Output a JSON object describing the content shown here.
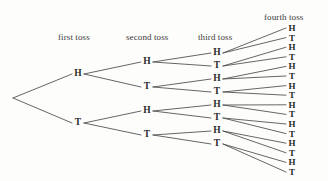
{
  "diagram": {
    "background_color": "#fdfdfc",
    "line_color": "#4a4a4a",
    "text_color": "#2b2b2b",
    "label_color": "#3b3b3b",
    "width": 328,
    "height": 181
  },
  "column_labels": [
    {
      "id": "first-toss",
      "text": "first toss",
      "x": 58,
      "y": 32
    },
    {
      "id": "second-toss",
      "text": "second toss",
      "x": 126,
      "y": 32
    },
    {
      "id": "third-toss",
      "text": "third toss",
      "x": 198,
      "y": 32
    },
    {
      "id": "fourth-toss",
      "text": "fourth toss",
      "x": 264,
      "y": 12
    }
  ],
  "root": {
    "id": "root",
    "x": 13,
    "y": 98
  },
  "levels": [
    {
      "name": "first-toss",
      "x": 78,
      "nodes": [
        {
          "id": "n-H",
          "label": "H",
          "y": 74
        },
        {
          "id": "n-T",
          "label": "T",
          "y": 123
        }
      ]
    },
    {
      "name": "second-toss",
      "x": 147,
      "nodes": [
        {
          "id": "n-HH",
          "label": "H",
          "y": 62,
          "parent": "n-H"
        },
        {
          "id": "n-HT",
          "label": "T",
          "y": 87,
          "parent": "n-H"
        },
        {
          "id": "n-TH",
          "label": "H",
          "y": 111,
          "parent": "n-T"
        },
        {
          "id": "n-TT",
          "label": "T",
          "y": 135,
          "parent": "n-T"
        }
      ]
    },
    {
      "name": "third-toss",
      "x": 217,
      "nodes": [
        {
          "id": "n-HHH",
          "label": "H",
          "y": 53,
          "parent": "n-HH"
        },
        {
          "id": "n-HHT",
          "label": "T",
          "y": 66,
          "parent": "n-HH"
        },
        {
          "id": "n-HTH",
          "label": "H",
          "y": 79,
          "parent": "n-HT"
        },
        {
          "id": "n-HTT",
          "label": "T",
          "y": 92,
          "parent": "n-HT"
        },
        {
          "id": "n-THH",
          "label": "H",
          "y": 105,
          "parent": "n-TH"
        },
        {
          "id": "n-THT",
          "label": "T",
          "y": 118,
          "parent": "n-TH"
        },
        {
          "id": "n-TTH",
          "label": "H",
          "y": 131,
          "parent": "n-TT"
        },
        {
          "id": "n-TTT",
          "label": "T",
          "y": 144,
          "parent": "n-TT"
        }
      ]
    },
    {
      "name": "fourth-toss",
      "x": 292,
      "nodes": [
        {
          "id": "n-HHHH",
          "label": "H",
          "y": 28,
          "parent": "n-HHH"
        },
        {
          "id": "n-HHHT",
          "label": "T",
          "y": 37.6,
          "parent": "n-HHH"
        },
        {
          "id": "n-HHTH",
          "label": "H",
          "y": 47.2,
          "parent": "n-HHT"
        },
        {
          "id": "n-HHTT",
          "label": "T",
          "y": 56.8,
          "parent": "n-HHT"
        },
        {
          "id": "n-HTHH",
          "label": "H",
          "y": 66.4,
          "parent": "n-HTH"
        },
        {
          "id": "n-HTHT",
          "label": "T",
          "y": 76,
          "parent": "n-HTH"
        },
        {
          "id": "n-HTTH",
          "label": "H",
          "y": 85.6,
          "parent": "n-HTT"
        },
        {
          "id": "n-HTTT",
          "label": "T",
          "y": 95.2,
          "parent": "n-HTT"
        },
        {
          "id": "n-THHH",
          "label": "H",
          "y": 104.8,
          "parent": "n-THH"
        },
        {
          "id": "n-THHT",
          "label": "T",
          "y": 114.4,
          "parent": "n-THH"
        },
        {
          "id": "n-THTH",
          "label": "H",
          "y": 124,
          "parent": "n-THT"
        },
        {
          "id": "n-THTT",
          "label": "T",
          "y": 133.6,
          "parent": "n-THT"
        },
        {
          "id": "n-TTHH",
          "label": "H",
          "y": 143.2,
          "parent": "n-TTH"
        },
        {
          "id": "n-TTHT",
          "label": "T",
          "y": 152.8,
          "parent": "n-TTH"
        },
        {
          "id": "n-TTTH",
          "label": "H",
          "y": 162.4,
          "parent": "n-TTT"
        },
        {
          "id": "n-TTTT",
          "label": "T",
          "y": 172,
          "parent": "n-TTT"
        }
      ]
    }
  ]
}
